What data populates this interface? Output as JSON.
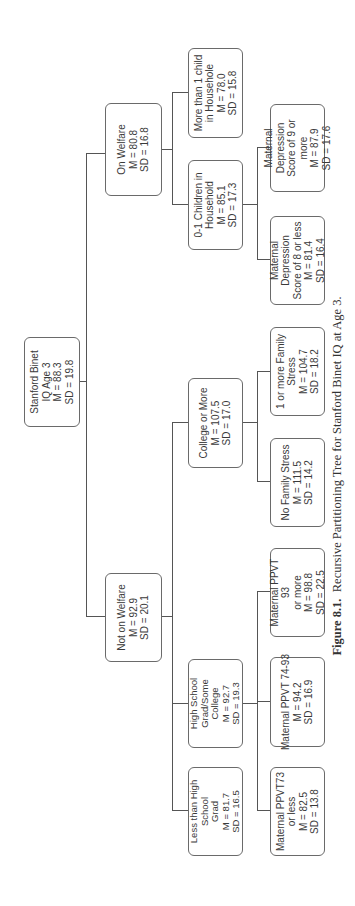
{
  "figure": {
    "caption_label": "Figure 8.1.",
    "caption_text": "Recursive Partitioning Tree for Stanford Binet IQ at Age 3."
  },
  "tree": {
    "root": {
      "lines": [
        "Stanford Binet",
        "IQ Age 3"
      ],
      "M": "M = 88.3",
      "SD": "SD = 19.8"
    },
    "on_welfare": {
      "lines": [
        "On Welfare"
      ],
      "M": "M = 80.8",
      "SD": "SD = 16.8"
    },
    "not_on_welfare": {
      "lines": [
        "Not on Welfare"
      ],
      "M": "M = 92.9",
      "SD": "SD = 20.1"
    },
    "more_than_1_child": {
      "lines": [
        "More than 1 child",
        "in Househole"
      ],
      "M": "M = 78.0",
      "SD": "SD = 15.8"
    },
    "zero_one_children": {
      "lines": [
        "0-1 Children in",
        "Household"
      ],
      "M": "M = 85.1",
      "SD": "SD = 17.3"
    },
    "mat_dep_9_more": {
      "lines": [
        "Maternal Depression",
        "Score of 9 or more"
      ],
      "M": "M = 87.9",
      "SD": "SD = 17.6"
    },
    "mat_dep_8_less": {
      "lines": [
        "Maternal Depression",
        "Score of 8 or less"
      ],
      "M": "M = 81.4",
      "SD": "SD = 16.4"
    },
    "college_or_more": {
      "lines": [
        "College or More"
      ],
      "M": "M = 107.5",
      "SD": "SD = 17.0"
    },
    "one_or_more_stress": {
      "lines": [
        "1 or more Family",
        "Stress"
      ],
      "M": "M = 104.7",
      "SD": "SD = 18.2"
    },
    "no_family_stress": {
      "lines": [
        "No Family Stress"
      ],
      "M": "M = 111.5",
      "SD": "SD = 14.2"
    },
    "hs_grad_some_college": {
      "lines": [
        "High School",
        "Grad/Some",
        "College"
      ],
      "M": "M = 92.7",
      "SD": "SD = 19.3"
    },
    "less_than_hs": {
      "lines": [
        "Less than High",
        "School",
        "Grad"
      ],
      "M": "M = 81.7",
      "SD": "SD = 16.5"
    },
    "ppvt_93_more": {
      "lines": [
        "Maternal PPVT 93",
        "or more"
      ],
      "M": "M = 98.8",
      "SD": "SD = 22.5"
    },
    "ppvt_74_93": {
      "lines": [
        "Maternal PPVT 74-93"
      ],
      "M": "M = 94.2",
      "SD": "SD = 16.9"
    },
    "ppvt_73_less": {
      "lines": [
        "Maternal PPVT73",
        "or less"
      ],
      "M": "M = 82.5",
      "SD": "SD = 13.8"
    }
  },
  "colors": {
    "line": "#555555",
    "border": "#6a6a6a",
    "text": "#3a3a3a",
    "background": "#ffffff"
  }
}
